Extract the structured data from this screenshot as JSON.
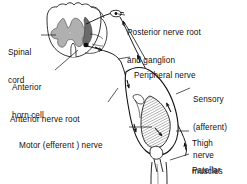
{
  "figure": {
    "background_color": "#ffffff",
    "ink_color": "#111111",
    "gray_matter_color": "#b0b0b0"
  },
  "labels": {
    "posterior_root": {
      "line1": "Posterior nerve root",
      "line2": "and ganglion"
    },
    "spinal_cord": {
      "line1": "Spinal",
      "line2": "cord"
    },
    "peripheral_nerve": {
      "line1": "Peripheral nerve"
    },
    "anterior_horn_cell": {
      "line1": "Anterior",
      "line2": "horn cell"
    },
    "sensory_nerve": {
      "line1": "Sensory",
      "line2": "(afferent)",
      "line3": "nerve"
    },
    "anterior_nerve_root": {
      "line1": "Anterior nerve root"
    },
    "motor_nerve": {
      "line1": "Motor (efferent ) nerve"
    },
    "thigh_muscles": {
      "line1": "Thigh",
      "line2": "muscles"
    },
    "patellar_tendon": {
      "line1": "Patellar",
      "line2": "tendon"
    }
  },
  "structures": {
    "spinal_cord_section": "spinal-cord-cross-section",
    "gray_matter": "butterfly-gray-matter",
    "dorsal_root_ganglion": "ganglion-swelling",
    "synapse": "anterior-horn-cell-synapse",
    "thigh": "thigh-muscle-belly",
    "patella": "patella-bone",
    "tendon": "patellar-tendon",
    "lower_leg": "lower-leg"
  },
  "flow_arrows": [
    {
      "name": "sensory-inflow-to-cord",
      "direction": "toward-spinal-cord"
    },
    {
      "name": "sensory-along-peripheral-nerve",
      "direction": "toward-spinal-cord"
    },
    {
      "name": "sensory-from-muscle",
      "direction": "toward-spinal-cord"
    },
    {
      "name": "motor-outflow-from-cord",
      "direction": "toward-muscle"
    },
    {
      "name": "motor-along-nerve",
      "direction": "toward-muscle"
    },
    {
      "name": "motor-to-muscle",
      "direction": "toward-muscle"
    }
  ]
}
